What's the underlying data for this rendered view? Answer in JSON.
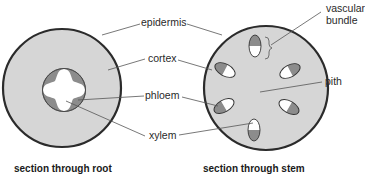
{
  "diagram": {
    "colors": {
      "outline": "#2b2b2b",
      "cortex": "#d6d6d6",
      "phloem": "#8c8c8c",
      "xylem": "#ffffff",
      "leader": "#555555"
    },
    "labels": {
      "epidermis": "epidermis",
      "cortex": "cortex",
      "phloem": "phloem",
      "xylem": "xylem",
      "vascular_bundle_line1": "vascular",
      "vascular_bundle_line2": "bundle",
      "pith": "pith"
    },
    "captions": {
      "root": "section through root",
      "stem": "section through stem"
    },
    "root": {
      "cx": 62,
      "cy": 88,
      "r": 59,
      "stele_r": 22
    },
    "stem": {
      "cx": 266,
      "cy": 88,
      "r": 62,
      "vascular_bundle_count": 6
    }
  }
}
